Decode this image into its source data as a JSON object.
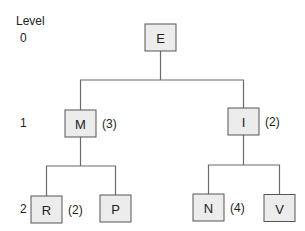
{
  "level_header": "Level",
  "levels": [
    "0",
    "1",
    "2"
  ],
  "nodes": [
    {
      "id": "E",
      "label": "E",
      "level": 0,
      "annotation": ""
    },
    {
      "id": "M",
      "label": "M",
      "level": 1,
      "annotation": "(3)"
    },
    {
      "id": "I",
      "label": "I",
      "level": 1,
      "annotation": "(2)"
    },
    {
      "id": "R",
      "label": "R",
      "level": 2,
      "annotation": "(2)"
    },
    {
      "id": "P",
      "label": "P",
      "level": 2,
      "annotation": ""
    },
    {
      "id": "N",
      "label": "N",
      "level": 2,
      "annotation": "(4)"
    },
    {
      "id": "V",
      "label": "V",
      "level": 2,
      "annotation": ""
    }
  ],
  "edges": [
    {
      "from": "E",
      "to": "M"
    },
    {
      "from": "E",
      "to": "I"
    },
    {
      "from": "M",
      "to": "R"
    },
    {
      "from": "M",
      "to": "P"
    },
    {
      "from": "I",
      "to": "N"
    },
    {
      "from": "I",
      "to": "V"
    }
  ]
}
